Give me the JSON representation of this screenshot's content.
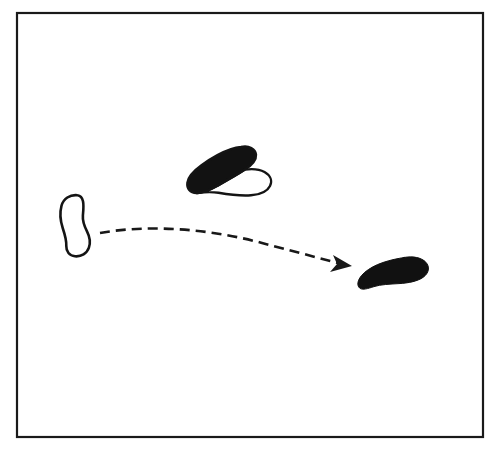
{
  "figure": {
    "caption": "Line drawing: an open outlined blob at left, a partly filled blob with an outlined lobe at upper middle, and a solid filled blob at lower right, connected by a dashed arrow curving from the left blob to the right blob.",
    "background_color": "#ffffff",
    "ink_color": "#111111",
    "frame": {
      "name": "outer-border",
      "x": 17,
      "y": 13,
      "width": 466,
      "height": 424,
      "stroke_width": 2.2,
      "stroke_color": "#1a1a1a",
      "fill": "none"
    },
    "shapes": [
      {
        "id": "shape-left-outline",
        "label": "left outlined blob",
        "style": "outline",
        "fill": "none",
        "stroke_color": "#141414",
        "stroke_width": 2.6,
        "bbox": {
          "x": 58,
          "y": 194,
          "width": 34,
          "height": 64
        },
        "path": "M 77.5 195.2 C 70.0 194.3 63.3 198.8 61.5 205.8 C 59.6 213.0 60.4 221.0 62.7 228.0 C 64.9 234.6 66.6 240.2 66.3 246.0 C 66.1 251.5 69.4 255.8 75.0 256.3 C 81.2 256.9 86.9 253.6 88.9 247.7 C 90.7 242.4 89.6 236.5 87.0 231.4 C 84.2 225.9 82.4 221.0 82.9 215.4 C 83.4 209.9 83.9 205.3 83.0 201.2 C 82.2 197.6 80.6 195.5 77.5 195.2 Z"
      },
      {
        "id": "shape-middle-mixed",
        "label": "middle blob, filled upper lobe with outlined lower lobe",
        "style": "mixed",
        "fill_color": "#121212",
        "stroke_color": "#141414",
        "stroke_width": 2.4,
        "bbox": {
          "x": 187,
          "y": 145,
          "width": 86,
          "height": 51
        },
        "filled_path": "M 241.0 147.0 C 249.0 145.3 255.5 148.8 256.0 154.6 C 256.5 160.4 252.0 165.0 245.0 169.6 C 236.0 175.5 226.0 181.0 217.0 186.0 C 209.5 190.2 202.5 193.4 196.5 193.0 C 190.0 192.6 186.6 188.5 187.4 182.6 C 188.2 176.4 193.5 171.0 201.5 165.2 C 211.0 158.3 222.0 152.2 231.0 149.2 C 234.6 148.0 238.0 147.3 241.0 147.0 Z",
        "outline_path": "M 245.0 169.6 C 252.5 168.6 259.5 169.2 264.5 172.0 C 270.5 175.4 272.6 180.8 270.0 186.0 C 267.3 191.4 260.5 194.6 251.0 195.3 C 241.0 196.0 229.0 194.6 218.5 192.8 C 209.0 191.2 200.5 192.6 196.5 193.0 C 202.5 193.4 209.5 190.2 217.0 186.0 C 226.0 181.0 236.0 175.5 245.0 169.6 Z"
      },
      {
        "id": "shape-right-filled",
        "label": "right solid filled blob",
        "style": "filled",
        "fill_color": "#111111",
        "stroke_color": "#111111",
        "stroke_width": 1,
        "bbox": {
          "x": 357,
          "y": 256,
          "width": 72,
          "height": 35
        },
        "path": "M 404.0 257.5 C 413.0 255.8 421.5 257.6 425.8 262.2 C 430.2 266.9 429.0 273.2 423.0 277.4 C 417.2 281.4 408.5 283.0 399.0 283.6 C 389.5 284.2 381.0 284.4 374.0 286.6 C 368.0 288.5 362.5 290.5 359.6 288.0 C 356.6 285.4 357.6 280.2 361.5 275.6 C 365.2 271.2 370.8 267.6 377.5 264.6 C 384.3 261.6 393.0 259.5 399.5 258.3 C 401.0 258.0 402.6 257.8 404.0 257.5 Z"
      }
    ],
    "arrow": {
      "id": "motion-arrow",
      "label": "dashed curved motion arrow",
      "style": "dashed",
      "stroke_color": "#181818",
      "stroke_width": 2.6,
      "dash_pattern": "10 6",
      "start": {
        "x": 100,
        "y": 233
      },
      "end": {
        "x": 352,
        "y": 266
      },
      "path": "M 100 233 C 150 224 210 229 262 243 C 300 253 330 261 350 266",
      "head": {
        "name": "arrowhead",
        "points": "352,266 333,255 337,264 330,272",
        "fill_color": "#181818"
      }
    }
  }
}
